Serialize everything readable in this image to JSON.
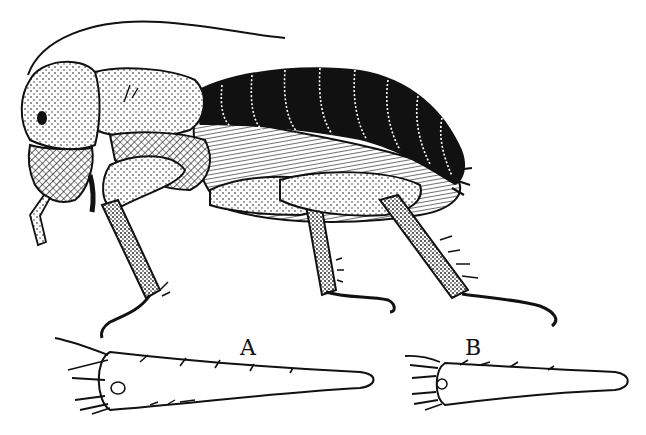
{
  "figure": {
    "background_color": "#ffffff",
    "ink_color": "#111111",
    "labels": {
      "a": "A",
      "b": "B"
    },
    "parts": {
      "main": "whole insect, side view",
      "detail_a": "appendage detail A",
      "detail_b": "appendage detail B"
    }
  }
}
